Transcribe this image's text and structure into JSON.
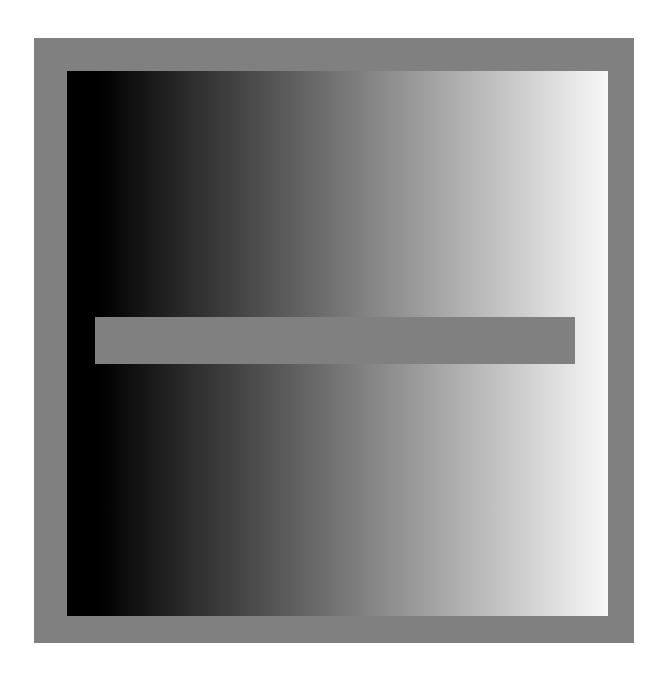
{
  "illusion": {
    "frame_color": "#808080",
    "gradient_start": "#000000",
    "gradient_end": "#f8f8f8",
    "bar_color": "#808080"
  }
}
